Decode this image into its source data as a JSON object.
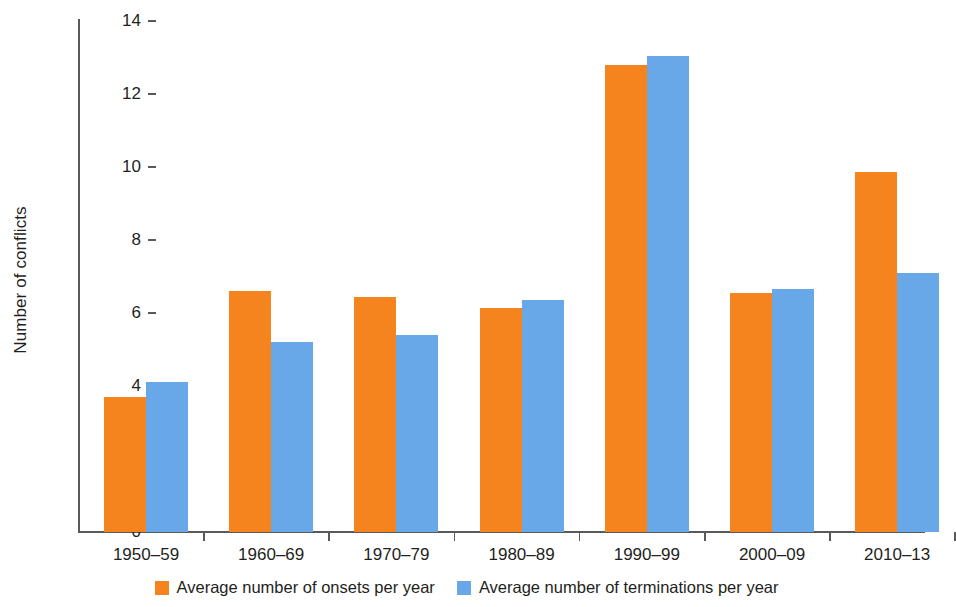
{
  "chart_data": {
    "type": "bar",
    "title": "",
    "subtitle": "",
    "xlabel": "",
    "ylabel": "Number of conflicts",
    "ylim": [
      0,
      14
    ],
    "ytick_step": 2,
    "yticks": [
      0,
      2,
      4,
      6,
      8,
      10,
      12,
      14
    ],
    "ytick_labels": [
      "0",
      "2",
      "4",
      "6",
      "8",
      "10",
      "12",
      "14"
    ],
    "grid": false,
    "legend_position": "bottom-center",
    "categories": [
      "1950–59",
      "1960–69",
      "1970–79",
      "1980–89",
      "1990–99",
      "2000–09",
      "2010–13"
    ],
    "series": [
      {
        "name": "Average number of onsets per year",
        "color": "#f5841f",
        "values": [
          3.7,
          6.6,
          6.45,
          6.15,
          12.8,
          6.55,
          9.85
        ]
      },
      {
        "name": "Average number of terminations per year",
        "color": "#69a8e8",
        "values": [
          4.1,
          5.2,
          5.4,
          6.35,
          13.05,
          6.65,
          7.1
        ]
      }
    ]
  },
  "legend": {
    "items": [
      {
        "label": "Average number of onsets per year",
        "swatch": "onsets"
      },
      {
        "label": "Average number of terminations per year",
        "swatch": "terminations"
      }
    ]
  },
  "axes": {
    "y_title": "Number of conflicts"
  },
  "colors": {
    "onsets": "#f5841f",
    "terminations": "#69a8e8",
    "axis": "#58595b",
    "text": "#231f20",
    "background": "#ffffff"
  }
}
